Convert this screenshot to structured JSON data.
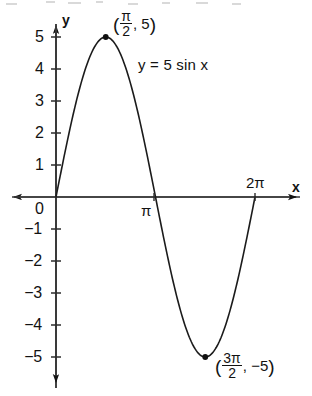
{
  "figure": {
    "equation_label": "y = 5 sin x",
    "axis_x_name": "x",
    "axis_y_name": "y",
    "origin_label": "0",
    "background_color": "#ffffff",
    "ink_color": "#121212"
  },
  "y_axis": {
    "ticks_positive": [
      "5",
      "4",
      "3",
      "2",
      "1"
    ],
    "ticks_negative": [
      "−1",
      "−2",
      "−3",
      "−4",
      "−5"
    ]
  },
  "x_axis": {
    "tick_pi": "π",
    "tick_two_pi": "2π"
  },
  "annotations": {
    "max_point": {
      "open_paren": "(",
      "numerator": "π",
      "denominator": "2",
      "comma": ",",
      "y_value": "5",
      "close_paren": ")"
    },
    "min_point": {
      "open_paren": "(",
      "numerator": "3π",
      "denominator": "2",
      "comma": ",",
      "y_value": "−5",
      "close_paren": ")"
    }
  },
  "chart_data": {
    "type": "line",
    "title": "",
    "subtitle": "",
    "xlabel": "x",
    "ylabel": "y",
    "equation": "y = 5 sin x",
    "amplitude": 5,
    "period": "2π",
    "xlim": [
      "0",
      "2π"
    ],
    "ylim": [
      -5,
      5
    ],
    "grid": false,
    "legend": "none",
    "y_tick_values": [
      5,
      4,
      3,
      2,
      1,
      0,
      -1,
      -2,
      -3,
      -4,
      -5
    ],
    "x_tick_labels": [
      "0",
      "π",
      "2π"
    ],
    "x_tick_values": [
      0,
      3.14159,
      6.28319
    ],
    "series": [
      {
        "name": "y = 5 sin x",
        "x": [
          0,
          0.3927,
          0.7854,
          1.1781,
          1.5708,
          1.9635,
          2.3562,
          2.7489,
          3.1416,
          3.5343,
          3.927,
          4.3197,
          4.7124,
          5.1051,
          5.4978,
          5.8905,
          6.2832
        ],
        "values": [
          0,
          1.91,
          3.54,
          4.62,
          5,
          4.62,
          3.54,
          1.91,
          0,
          -1.91,
          -3.54,
          -4.62,
          -5,
          -4.62,
          -3.54,
          -1.91,
          0
        ]
      }
    ],
    "marked_points": [
      {
        "label": "(π/2, 5)",
        "x": 1.5708,
        "y": 5
      },
      {
        "label": "(3π/2, −5)",
        "x": 4.7124,
        "y": -5
      }
    ]
  }
}
